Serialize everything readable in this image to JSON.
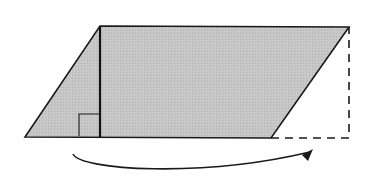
{
  "diagram": {
    "title": "",
    "colors": {
      "fill": "#c4c4c4",
      "stroke": "#1a1a1a",
      "background": "#ffffff"
    },
    "parallelogram": {
      "points": [
        [
          25,
          137
        ],
        [
          100,
          26
        ],
        [
          349,
          27
        ],
        [
          271,
          138
        ]
      ]
    },
    "height_line": {
      "x1": 100,
      "y1": 26,
      "x2": 100,
      "y2": 137
    },
    "right_angle_marker": {
      "x": 79,
      "y": 114,
      "size": 22
    },
    "dashed_triangle": {
      "points": [
        [
          271,
          138
        ],
        [
          349,
          138
        ],
        [
          349,
          27
        ]
      ]
    },
    "arrow": {
      "path": "M 73 154 C 80 170, 200 178, 310 152",
      "head": [
        [
          313,
          149
        ],
        [
          302,
          155
        ],
        [
          308,
          161
        ]
      ]
    },
    "labels": []
  }
}
